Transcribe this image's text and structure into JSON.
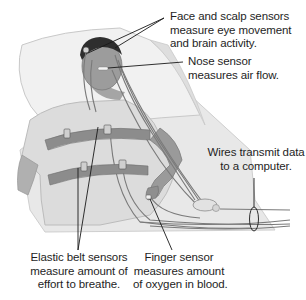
{
  "diagram": {
    "colors": {
      "background": "#ffffff",
      "pillow": "#eeeeee",
      "sheet": "#e6e6e6",
      "skin": "#9a9a9a",
      "hair": "#2e2e2e",
      "gown": "#d8d8d8",
      "belt": "#8a8a8a",
      "wire": "#7a7a7a",
      "leader_line": "#1a1a1a",
      "text": "#1e1e1e"
    },
    "callouts": [
      {
        "id": "face-scalp",
        "lines": [
          "Face and scalp sensors",
          "measure eye movement",
          "and brain activity."
        ]
      },
      {
        "id": "nose",
        "lines": [
          "Nose sensor",
          "measures air flow."
        ]
      },
      {
        "id": "wires",
        "lines": [
          "Wires transmit data",
          "to a computer."
        ]
      },
      {
        "id": "belts",
        "lines": [
          "Elastic belt sensors",
          "measure amount of",
          "effort to breathe."
        ]
      },
      {
        "id": "finger",
        "lines": [
          "Finger sensor",
          "measures amount",
          "of oxygen in blood."
        ]
      }
    ]
  }
}
